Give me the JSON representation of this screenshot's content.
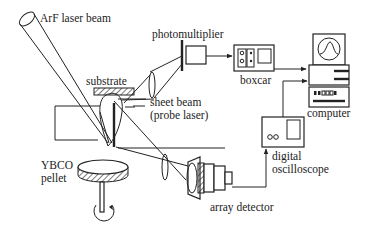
{
  "diagram": {
    "type": "experimental-apparatus",
    "labels": {
      "laser": "ArF laser beam",
      "photomultiplier": "photomultiplier",
      "boxcar": "boxcar",
      "substrate": "substrate",
      "sheet_beam_line1": "sheet beam",
      "sheet_beam_line2": "(probe laser)",
      "computer": "computer",
      "ybco_line1": "YBCO",
      "ybco_line2": "pellet",
      "digital_line1": "digital",
      "digital_line2": "oscilloscope",
      "array_detector": "array detector"
    },
    "connections": [
      {
        "from": "photomultiplier",
        "to": "boxcar"
      },
      {
        "from": "boxcar",
        "to": "computer"
      },
      {
        "from": "digital oscilloscope",
        "to": "computer"
      },
      {
        "from": "array detector",
        "to": "digital oscilloscope"
      }
    ],
    "colors": {
      "line": "#222222",
      "background": "#ffffff"
    }
  }
}
